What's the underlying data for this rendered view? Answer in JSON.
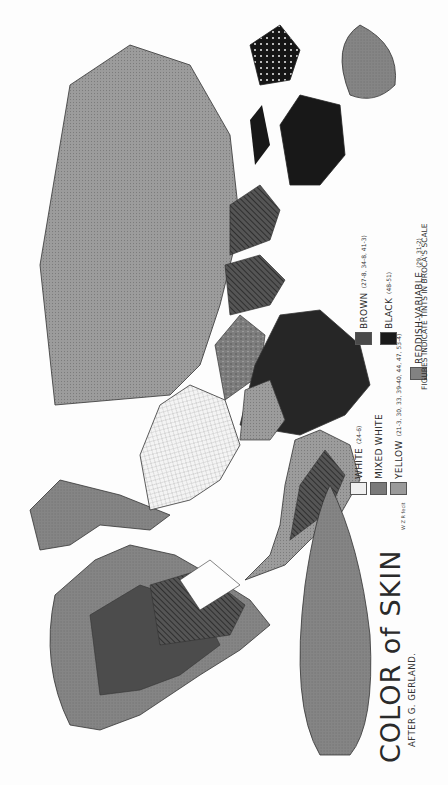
{
  "map": {
    "title": "COLOR of SKIN",
    "subtitle": "AFTER G. GERLAND.",
    "credit": "W Z R fecit",
    "scale_note": "FIGURES INDICATE TINTS IN BROCA'S SCALE",
    "orientation": "rotated 90° counter-clockwise",
    "legend": [
      {
        "label": "WHITE",
        "value": "(24-6)",
        "color": "#efefef",
        "pattern": "light-crosshatch"
      },
      {
        "label": "MIXED WHITE",
        "value": "",
        "color": "#7a7a7a",
        "pattern": "mottled"
      },
      {
        "label": "YELLOW",
        "value": "(21-3, 30, 33, 39-40, 44, 47, 53-4)",
        "color": "#9a9a9a",
        "pattern": "stipple"
      },
      {
        "label": "REDDISH-VARIABLE",
        "value": "(29, 31-2)",
        "color": "#828282",
        "pattern": "fine-stipple"
      },
      {
        "label": "BROWN",
        "value": "(27-8, 34-8, 41-3)",
        "color": "#4a4a4a",
        "pattern": "diagonal-hatch"
      },
      {
        "label": "BLACK",
        "value": "(48-51)",
        "color": "#1a1a1a",
        "pattern": "solid"
      }
    ],
    "regions": [
      {
        "name": "North America",
        "dominant": "REDDISH-VARIABLE"
      },
      {
        "name": "Greenland",
        "dominant": "REDDISH-VARIABLE"
      },
      {
        "name": "South America",
        "dominant": "BROWN / YELLOW"
      },
      {
        "name": "Europe",
        "dominant": "WHITE"
      },
      {
        "name": "North Africa & Middle East",
        "dominant": "MIXED WHITE / YELLOW"
      },
      {
        "name": "Sub-Saharan Africa",
        "dominant": "BLACK"
      },
      {
        "name": "Asia",
        "dominant": "YELLOW"
      },
      {
        "name": "India & Southeast Asia",
        "dominant": "BROWN"
      },
      {
        "name": "Australia",
        "dominant": "BLACK"
      },
      {
        "name": "Antarctica",
        "dominant": "REDDISH-VARIABLE"
      }
    ]
  }
}
